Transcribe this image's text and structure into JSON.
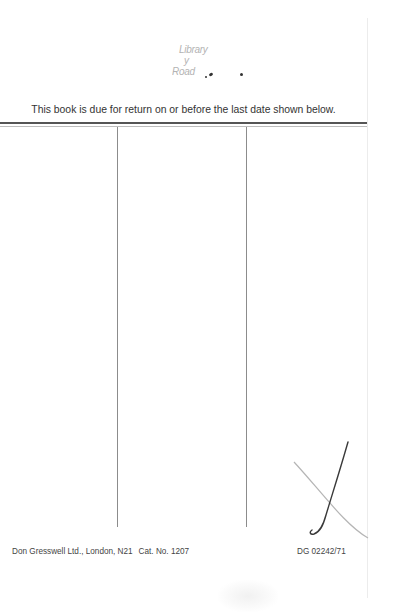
{
  "document": {
    "type": "library date-due slip",
    "stamp": {
      "lines": [
        "Library",
        "y",
        "Road"
      ],
      "note": "faded ink stamp, partially illegible"
    },
    "notice": "This book is due for return on or before the last date shown below.",
    "date_columns": [
      {
        "index": 1,
        "entries": []
      },
      {
        "index": 2,
        "entries": []
      },
      {
        "index": 3,
        "entries": []
      }
    ],
    "handwritten_mark": "check-mark-icon",
    "footer": {
      "publisher": "Don Gresswell Ltd., London, N21",
      "catalogue": "Cat. No. 1207",
      "code": "DG 02242/71"
    },
    "colors": {
      "paper": "#ffffff",
      "ink": "#333333",
      "rule": "#555555",
      "column_line": "#8c8c8c"
    }
  }
}
